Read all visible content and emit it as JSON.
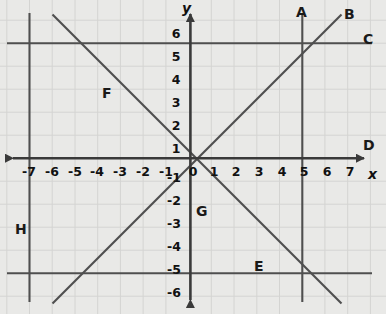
{
  "figure": {
    "kind": "coordinate-plane-line-graph",
    "background_color": "#e9e9e7",
    "grid_color": "#d2d2d0",
    "axis_color": "#3a3a3a",
    "line_color": "#4a4a4a",
    "label_color": "#1a1a1a"
  },
  "axes": {
    "x_axis_label": "x",
    "y_axis_label": "y",
    "origin_label": "0",
    "x_ticks": [
      "-7",
      "-6",
      "-5",
      "-4",
      "-3",
      "-2",
      "-1",
      "0",
      "1",
      "2",
      "3",
      "4",
      "5",
      "6",
      "7"
    ],
    "y_ticks_positive": [
      "1",
      "2",
      "3",
      "4",
      "5",
      "6"
    ],
    "y_ticks_negative": [
      "-1",
      "-2",
      "-3",
      "-4",
      "-5",
      "-6"
    ],
    "xlim": [
      -7.6,
      7.8
    ],
    "ylim": [
      -6.4,
      6.4
    ],
    "x_arrows": "both",
    "y_arrows": "both"
  },
  "chart_data": {
    "type": "line",
    "title": "",
    "xlabel": "x",
    "ylabel": "y",
    "xlim": [
      -7.6,
      7.8
    ],
    "ylim": [
      -6.4,
      6.4
    ],
    "grid": true,
    "legend": "none",
    "series": [
      {
        "name": "A",
        "equation": "x = 5",
        "orientation": "vertical",
        "value": 5,
        "x": [
          5,
          5
        ],
        "y": [
          -6.2,
          6.3
        ]
      },
      {
        "name": "B",
        "equation": "y = x",
        "orientation": "diagonal",
        "slope": 1,
        "intercept": 0,
        "x": [
          -6.1,
          6.6
        ],
        "y": [
          -6.3,
          6.3
        ]
      },
      {
        "name": "C",
        "equation": "y = 5",
        "orientation": "horizontal",
        "value": 5,
        "x": [
          -7.6,
          7.6
        ],
        "y": [
          5,
          5
        ]
      },
      {
        "name": "E",
        "equation": "y = -5",
        "orientation": "horizontal",
        "value": -5,
        "x": [
          -7.6,
          7.6
        ],
        "y": [
          -5,
          -5
        ]
      },
      {
        "name": "F",
        "equation": "y = -x",
        "orientation": "diagonal",
        "slope": -1,
        "intercept": 0,
        "x": [
          -6.1,
          6.6
        ],
        "y": [
          6.3,
          -6.3
        ]
      },
      {
        "name": "H",
        "equation": "x = -7",
        "orientation": "vertical",
        "value": -7,
        "x": [
          -7,
          -7
        ],
        "y": [
          -6.2,
          6.3
        ]
      }
    ]
  },
  "line_labels": [
    {
      "id": "A",
      "text": "A",
      "x": 296,
      "y": 5,
      "describes": "vertical line x = 5"
    },
    {
      "id": "B",
      "text": "B",
      "x": 344,
      "y": 7,
      "describes": "diagonal line y = x"
    },
    {
      "id": "C",
      "text": "C",
      "x": 363,
      "y": 32,
      "describes": "horizontal line y = 5"
    },
    {
      "id": "D",
      "text": "D",
      "x": 363,
      "y": 138,
      "describes": "the x-axis"
    },
    {
      "id": "E",
      "text": "E",
      "x": 254,
      "y": 259,
      "describes": "horizontal line y = -5"
    },
    {
      "id": "F",
      "text": "F",
      "x": 102,
      "y": 86,
      "describes": "diagonal line y = -x"
    },
    {
      "id": "G",
      "text": "G",
      "x": 196,
      "y": 204,
      "describes": "the y-axis"
    },
    {
      "id": "H",
      "text": "H",
      "x": 15,
      "y": 222,
      "describes": "vertical line x = -7"
    }
  ],
  "tick_positions": {
    "x": [
      {
        "label": "-7",
        "px": 29,
        "py": 166
      },
      {
        "label": "-6",
        "px": 52,
        "py": 166
      },
      {
        "label": "-5",
        "px": 75,
        "py": 166
      },
      {
        "label": "-4",
        "px": 97,
        "py": 166
      },
      {
        "label": "-3",
        "px": 120,
        "py": 166
      },
      {
        "label": "-2",
        "px": 143,
        "py": 166
      },
      {
        "label": "-1",
        "px": 166,
        "py": 166
      },
      {
        "label": "0",
        "px": 193,
        "py": 166
      },
      {
        "label": "1",
        "px": 214,
        "py": 166
      },
      {
        "label": "2",
        "px": 236,
        "py": 166
      },
      {
        "label": "3",
        "px": 259,
        "py": 166
      },
      {
        "label": "4",
        "px": 282,
        "py": 166
      },
      {
        "label": "5",
        "px": 304,
        "py": 166
      },
      {
        "label": "6",
        "px": 327,
        "py": 166
      },
      {
        "label": "7",
        "px": 350,
        "py": 166
      }
    ],
    "y": [
      {
        "label": "6",
        "px": 176,
        "py": 28
      },
      {
        "label": "5",
        "px": 176,
        "py": 51
      },
      {
        "label": "4",
        "px": 176,
        "py": 74
      },
      {
        "label": "3",
        "px": 176,
        "py": 97
      },
      {
        "label": "2",
        "px": 176,
        "py": 120
      },
      {
        "label": "1",
        "px": 176,
        "py": 143
      },
      {
        "label": "-1",
        "px": 174,
        "py": 172
      },
      {
        "label": "-2",
        "px": 174,
        "py": 195
      },
      {
        "label": "-3",
        "px": 174,
        "py": 218
      },
      {
        "label": "-4",
        "px": 174,
        "py": 241
      },
      {
        "label": "-5",
        "px": 174,
        "py": 264
      },
      {
        "label": "-6",
        "px": 174,
        "py": 287
      }
    ]
  },
  "axis_names": [
    {
      "id": "y",
      "text": "y",
      "x": 182,
      "y": 2
    },
    {
      "id": "x",
      "text": "x",
      "x": 368,
      "y": 168
    }
  ]
}
